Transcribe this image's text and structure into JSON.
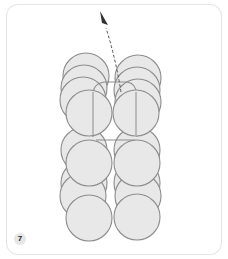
{
  "panel": {
    "step_number": "7",
    "description": "Stacked circles in two columns with an arrow pointing up-left"
  },
  "colors": {
    "circle_fill": "#e8e8e8",
    "circle_stroke": "#8c8c8c",
    "arrow": "#444444",
    "card_border": "#e4e4e4",
    "badge_fill": "#e6e6e6"
  },
  "diagram": {
    "columns": [
      {
        "name": "left",
        "circle_centers_y": [
          80,
          92,
          108,
          125,
          150,
          165,
          180,
          200,
          215
        ]
      },
      {
        "name": "right",
        "circle_centers_y": [
          80,
          92,
          108,
          125,
          150,
          165,
          180,
          200,
          215
        ]
      }
    ],
    "arrow": {
      "from": [
        120,
        80
      ],
      "to": [
        101,
        10
      ]
    }
  }
}
